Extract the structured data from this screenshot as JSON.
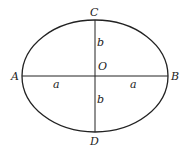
{
  "diagram": {
    "title": "",
    "shape": "ellipse",
    "colors": {
      "stroke": "#222222",
      "background": "#ffffff"
    },
    "ellipse": {
      "cx": 95,
      "cy": 76,
      "rx": 73,
      "ry": 56
    },
    "points": {
      "A": {
        "label": "A",
        "x": 14,
        "y": 80
      },
      "B": {
        "label": "B",
        "x": 172,
        "y": 80
      },
      "C": {
        "label": "C",
        "x": 91,
        "y": 15
      },
      "D": {
        "label": "D",
        "x": 91,
        "y": 145
      },
      "O": {
        "label": "O",
        "x": 98,
        "y": 69
      }
    },
    "segment_labels": {
      "a_left": {
        "label": "a",
        "x": 54,
        "y": 88
      },
      "a_right": {
        "label": "a",
        "x": 131,
        "y": 88
      },
      "b_top": {
        "label": "b",
        "x": 97,
        "y": 45
      },
      "b_bottom": {
        "label": "b",
        "x": 97,
        "y": 103
      }
    },
    "axes": {
      "major": {
        "from": "A",
        "to": "B"
      },
      "minor": {
        "from": "C",
        "to": "D"
      }
    }
  }
}
